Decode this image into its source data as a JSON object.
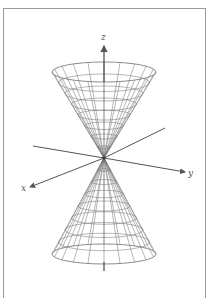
{
  "figure": {
    "axes": {
      "x_label": "x",
      "y_label": "y",
      "z_label": "z"
    },
    "colors": {
      "frame": "#9a9a9a",
      "mesh": "#6e6e6e",
      "axis": "#555555",
      "label": "#555555"
    },
    "geometry": {
      "apex": [
        104,
        158
      ],
      "upper_rim": {
        "cx": 104,
        "cy": 72,
        "rx": 52,
        "ry": 10
      },
      "lower_rim": {
        "cx": 104,
        "cy": 254,
        "rx": 52,
        "ry": 10
      },
      "meridians": 20,
      "parallels": 8
    }
  }
}
